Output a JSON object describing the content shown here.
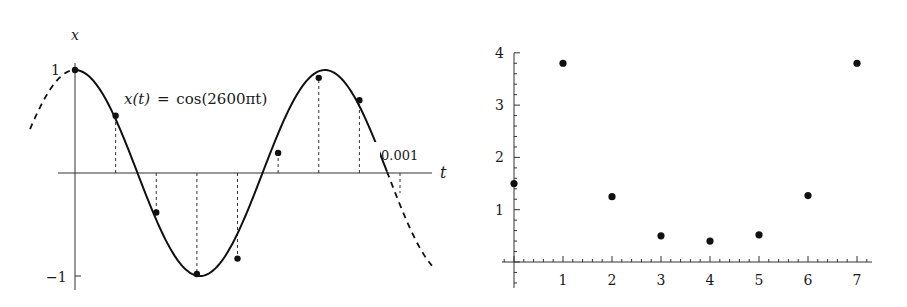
{
  "chart_data": [
    {
      "type": "line",
      "title": "",
      "annotation": "x(t) = cos(2600πt)",
      "xlabel": "t",
      "ylabel": "x",
      "y_ticks": [
        "1",
        "−1"
      ],
      "x_tick_annotation": "0.001",
      "function": "cos(2600*pi*t)",
      "t_range": [
        0,
        0.001
      ],
      "samples": {
        "n": [
          0,
          1,
          2,
          3,
          4,
          5,
          6,
          7,
          8
        ],
        "t": [
          0,
          0.000125,
          0.00025,
          0.000375,
          0.0005,
          0.000625,
          0.00075,
          0.000875,
          0.001
        ],
        "x": [
          1.0,
          0.556,
          -0.383,
          -0.981,
          -0.831,
          0.195,
          0.924,
          0.707,
          -0.195
        ]
      },
      "sample_points_marked": [
        0,
        1,
        2,
        3,
        4,
        5,
        6,
        7
      ],
      "dashed_extension": true,
      "grid": false
    },
    {
      "type": "scatter",
      "title": "",
      "xlabel": "",
      "ylabel": "",
      "x_ticks": [
        "1",
        "2",
        "3",
        "4",
        "5",
        "6",
        "7"
      ],
      "y_ticks": [
        "1",
        "2",
        "3",
        "4"
      ],
      "x": [
        0,
        1,
        2,
        3,
        4,
        5,
        6,
        7
      ],
      "y": [
        1.5,
        3.8,
        1.25,
        0.5,
        0.4,
        0.52,
        1.27,
        3.8
      ],
      "xlim": [
        -0.3,
        7.3
      ],
      "ylim": [
        -0.5,
        4.0
      ],
      "grid": false
    }
  ],
  "left_plot": {
    "y_axis_label": "x",
    "x_axis_label": "t",
    "y_tick_top": "1",
    "y_tick_bottom": "−1",
    "equation_lhs": "x(t)",
    "equation_eq": "=",
    "equation_rhs": "cos(2600πt)",
    "t_end_label": "0.001"
  },
  "right_plot": {
    "x_tick_labels": [
      "1",
      "2",
      "3",
      "4",
      "5",
      "6",
      "7"
    ],
    "y_tick_labels": [
      "1",
      "2",
      "3",
      "4"
    ]
  },
  "colors": {
    "ink": "#1a1a1a",
    "axis": "#333333",
    "background": "#ffffff"
  }
}
